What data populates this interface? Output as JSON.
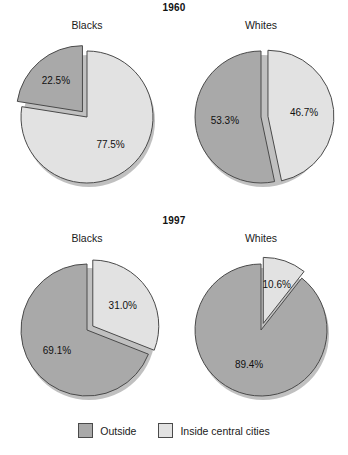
{
  "chart_data": {
    "type": "pie",
    "title": "",
    "legend_position": "bottom",
    "legend": [
      {
        "name": "Outside",
        "color": "#a9a9a9"
      },
      {
        "name": "Inside central cities",
        "color": "#e2e2e2"
      }
    ],
    "panels": [
      {
        "id": "1960-blacks",
        "group_heading": "1960",
        "label": "Blacks",
        "categories": [
          "Outside",
          "Inside central cities"
        ],
        "values": [
          22.5,
          77.5
        ],
        "value_labels": [
          "22.5%",
          "77.5%"
        ],
        "start_angle": 0,
        "direction": "counterclockwise",
        "exploded_index": 0
      },
      {
        "id": "1960-whites",
        "group_heading": "1960",
        "label": "Whites",
        "categories": [
          "Outside",
          "Inside central cities"
        ],
        "values": [
          53.3,
          46.7
        ],
        "value_labels": [
          "53.3%",
          "46.7%"
        ],
        "start_angle": 0,
        "direction": "counterclockwise",
        "exploded_index": 1
      },
      {
        "id": "1997-blacks",
        "group_heading": "1997",
        "label": "Blacks",
        "categories": [
          "Outside",
          "Inside central cities"
        ],
        "values": [
          69.1,
          31.0
        ],
        "value_labels": [
          "69.1%",
          "31.0%"
        ],
        "start_angle": 0,
        "direction": "counterclockwise",
        "exploded_index": 1
      },
      {
        "id": "1997-whites",
        "group_heading": "1997",
        "label": "Whites",
        "categories": [
          "Outside",
          "Inside central cities"
        ],
        "values": [
          89.4,
          10.6
        ],
        "value_labels": [
          "89.4%",
          "10.6%"
        ],
        "start_angle": 0,
        "direction": "counterclockwise",
        "exploded_index": 1
      }
    ]
  },
  "headings": {
    "year_1960": "1960",
    "year_1997": "1997"
  },
  "panels": {
    "p1960_blacks": {
      "label": "Blacks",
      "v0": "22.5%",
      "v1": "77.5%"
    },
    "p1960_whites": {
      "label": "Whites",
      "v0": "53.3%",
      "v1": "46.7%"
    },
    "p1997_blacks": {
      "label": "Blacks",
      "v0": "69.1%",
      "v1": "31.0%"
    },
    "p1997_whites": {
      "label": "Whites",
      "v0": "89.4%",
      "v1": "10.6%"
    }
  },
  "legend": {
    "outside_label": "Outside",
    "inside_label": "Inside central cities",
    "outside_color": "#a9a9a9",
    "inside_color": "#e2e2e2"
  }
}
